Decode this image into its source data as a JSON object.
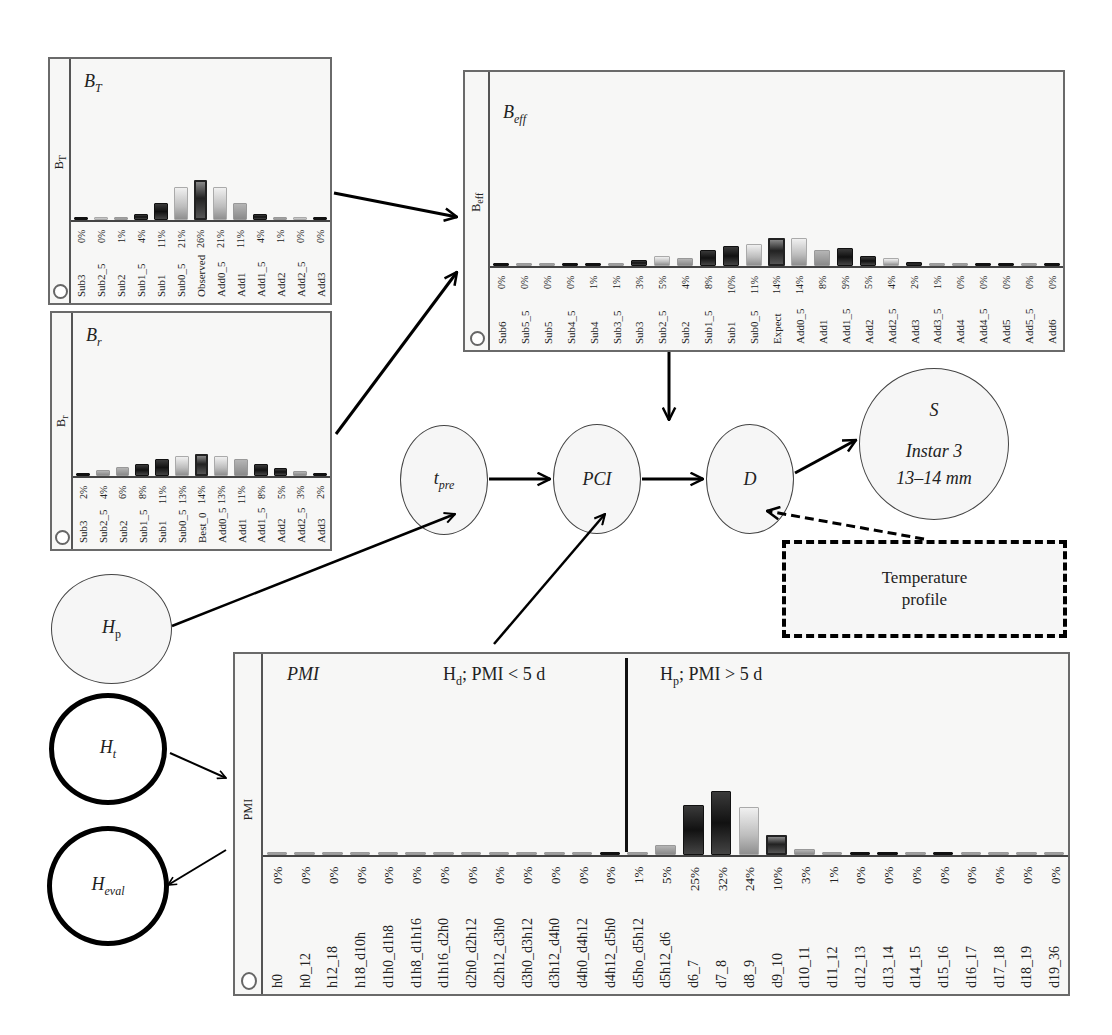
{
  "panels": {
    "bt": {
      "title_main": "B",
      "title_sub": "T",
      "ylabel": "B_T",
      "categories": [
        "Sub3",
        "Sub2_5",
        "Sub2",
        "Sub1_5",
        "Sub1",
        "Sub0_5",
        "Observed",
        "Add0_5",
        "Add1",
        "Add1_5",
        "Add2",
        "Add2_5",
        "Add3"
      ],
      "values": [
        0,
        0,
        1,
        4,
        11,
        21,
        26,
        21,
        11,
        4,
        1,
        0,
        0
      ],
      "labels": [
        "0%",
        "0%",
        "1%",
        "4%",
        "11%",
        "21%",
        "26%",
        "21%",
        "11%",
        "4%",
        "1%",
        "0%",
        "0%"
      ]
    },
    "br": {
      "title_main": "B",
      "title_sub": "r",
      "ylabel": "B_r",
      "categories": [
        "Sub3",
        "Sub2_5",
        "Sub2",
        "Sub1_5",
        "Sub1",
        "Sub0_5",
        "Best_0",
        "Add0_5",
        "Add1",
        "Add1_5",
        "Add2",
        "Add2_5",
        "Add3"
      ],
      "values": [
        2,
        4,
        6,
        8,
        11,
        13,
        14,
        13,
        11,
        8,
        5,
        3,
        2
      ],
      "labels": [
        "2%",
        "4%",
        "6%",
        "8%",
        "11%",
        "13%",
        "14%",
        "13%",
        "11%",
        "8%",
        "5%",
        "3%",
        "2%"
      ]
    },
    "beff": {
      "title_main": "B",
      "title_sub": "eff",
      "ylabel": "B_eff",
      "categories": [
        "Sub6",
        "Sub5_5",
        "Sub5",
        "Sub4_5",
        "Sub4",
        "Sub3_5",
        "Sub3",
        "Sub2_5",
        "Sub2",
        "Sub1_5",
        "Sub1",
        "Sub0_5",
        "Expect",
        "Add0_5",
        "Add1",
        "Add1_5",
        "Add2",
        "Add2_5",
        "Add3",
        "Add3_5",
        "Add4",
        "Add4_5",
        "Add5",
        "Add5_5",
        "Add6"
      ],
      "values": [
        0,
        0,
        0,
        0,
        1,
        1,
        3,
        5,
        4,
        8,
        10,
        11,
        14,
        14,
        8,
        9,
        5,
        4,
        2,
        1,
        0,
        0,
        0,
        0,
        0
      ],
      "labels": [
        "0%",
        "0%",
        "0%",
        "0%",
        "1%",
        "1%",
        "3%",
        "5%",
        "4%",
        "8%",
        "10%",
        "11%",
        "14%",
        "14%",
        "8%",
        "9%",
        "5%",
        "4%",
        "2%",
        "1%",
        "0%",
        "0%",
        "0%",
        "0%",
        "0%"
      ]
    },
    "pmi": {
      "title": "PMI",
      "ylabel": "PMI",
      "region_left": {
        "main": "H",
        "sub": "d",
        "rest": "; PMI < 5 d"
      },
      "region_right": {
        "main": "H",
        "sub": "p",
        "rest": "; PMI > 5 d"
      },
      "categories": [
        "h0",
        "h0_12",
        "h12_18",
        "h18_d10h",
        "d1h0_d1h8",
        "d1h8_d1h16",
        "d1h16_d2h0",
        "d2h0_d2h12",
        "d2h12_d3h0",
        "d3h0_d3h12",
        "d3h12_d4h0",
        "d4h0_d4h12",
        "d4h12_d5h0",
        "d5ho_d5h12",
        "d5h12_d6",
        "d6_7",
        "d7_8",
        "d8_9",
        "d9_10",
        "d10_11",
        "d11_12",
        "d12_13",
        "d13_14",
        "d14_15",
        "d15_16",
        "d16_17",
        "d17_18",
        "d18_19",
        "d19_36"
      ],
      "values": [
        0,
        0,
        0,
        0,
        0,
        0,
        0,
        0,
        0,
        0,
        0,
        0,
        0,
        1,
        5,
        25,
        32,
        24,
        10,
        3,
        1,
        0,
        0,
        0,
        0,
        0,
        0,
        0,
        0
      ],
      "labels": [
        "0%",
        "0%",
        "0%",
        "0%",
        "0%",
        "0%",
        "0%",
        "0%",
        "0%",
        "0%",
        "0%",
        "0%",
        "0%",
        "1%",
        "5%",
        "25%",
        "32%",
        "24%",
        "10%",
        "3%",
        "1%",
        "0%",
        "0%",
        "0%",
        "0%",
        "0%",
        "0%",
        "0%",
        "0%"
      ]
    }
  },
  "nodes": {
    "tpre": {
      "main": "t",
      "sub": "pre"
    },
    "pci": {
      "label": "PCI"
    },
    "d": {
      "label": "D"
    },
    "s": {
      "label": "S",
      "line1": "Instar 3",
      "line2": "13–14 mm"
    },
    "hp": {
      "main": "H",
      "sub": "p"
    },
    "ht": {
      "main": "H",
      "sub": "t"
    },
    "heval": {
      "main": "H",
      "sub": "eval"
    }
  },
  "temperature_box": {
    "line1": "Temperature",
    "line2": "profile"
  },
  "chart_data": [
    {
      "type": "bar",
      "title": "B_T",
      "categories": [
        "Sub3",
        "Sub2_5",
        "Sub2",
        "Sub1_5",
        "Sub1",
        "Sub0_5",
        "Observed",
        "Add0_5",
        "Add1",
        "Add1_5",
        "Add2",
        "Add2_5",
        "Add3"
      ],
      "values": [
        0,
        0,
        1,
        4,
        11,
        21,
        26,
        21,
        11,
        4,
        1,
        0,
        0
      ],
      "ylabel": "B_T",
      "unit": "%"
    },
    {
      "type": "bar",
      "title": "B_r",
      "categories": [
        "Sub3",
        "Sub2_5",
        "Sub2",
        "Sub1_5",
        "Sub1",
        "Sub0_5",
        "Best_0",
        "Add0_5",
        "Add1",
        "Add1_5",
        "Add2",
        "Add2_5",
        "Add3"
      ],
      "values": [
        2,
        4,
        6,
        8,
        11,
        13,
        14,
        13,
        11,
        8,
        5,
        3,
        2
      ],
      "ylabel": "B_r",
      "unit": "%"
    },
    {
      "type": "bar",
      "title": "B_eff",
      "categories": [
        "Sub6",
        "Sub5_5",
        "Sub5",
        "Sub4_5",
        "Sub4",
        "Sub3_5",
        "Sub3",
        "Sub2_5",
        "Sub2",
        "Sub1_5",
        "Sub1",
        "Sub0_5",
        "Expect",
        "Add0_5",
        "Add1",
        "Add1_5",
        "Add2",
        "Add2_5",
        "Add3",
        "Add3_5",
        "Add4",
        "Add4_5",
        "Add5",
        "Add5_5",
        "Add6"
      ],
      "values": [
        0,
        0,
        0,
        0,
        1,
        1,
        3,
        5,
        4,
        8,
        10,
        11,
        14,
        14,
        8,
        9,
        5,
        4,
        2,
        1,
        0,
        0,
        0,
        0,
        0
      ],
      "ylabel": "B_eff",
      "unit": "%"
    },
    {
      "type": "bar",
      "title": "PMI",
      "categories": [
        "h0",
        "h0_12",
        "h12_18",
        "h18_d10h",
        "d1h0_d1h8",
        "d1h8_d1h16",
        "d1h16_d2h0",
        "d2h0_d2h12",
        "d2h12_d3h0",
        "d3h0_d3h12",
        "d3h12_d4h0",
        "d4h0_d4h12",
        "d4h12_d5h0",
        "d5ho_d5h12",
        "d5h12_d6",
        "d6_7",
        "d7_8",
        "d8_9",
        "d9_10",
        "d10_11",
        "d11_12",
        "d12_13",
        "d13_14",
        "d14_15",
        "d15_16",
        "d16_17",
        "d17_18",
        "d18_19",
        "d19_36"
      ],
      "values": [
        0,
        0,
        0,
        0,
        0,
        0,
        0,
        0,
        0,
        0,
        0,
        0,
        0,
        1,
        5,
        25,
        32,
        24,
        10,
        3,
        1,
        0,
        0,
        0,
        0,
        0,
        0,
        0,
        0
      ],
      "ylabel": "PMI",
      "unit": "%",
      "annotations": [
        "H_d; PMI < 5 d",
        "H_p; PMI > 5 d"
      ]
    }
  ]
}
